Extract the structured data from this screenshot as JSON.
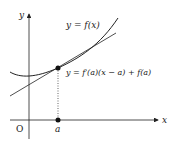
{
  "diagram": {
    "type": "tangent-line-diagram",
    "axes": {
      "x_label": "x",
      "y_label": "y",
      "origin_label": "O"
    },
    "curve_label": "y = f(x)",
    "tangent_label": "y = f′(a)(x − a) + f(a)",
    "point_label": "a",
    "colors": {
      "line": "#222222",
      "background": "#ffffff"
    }
  }
}
